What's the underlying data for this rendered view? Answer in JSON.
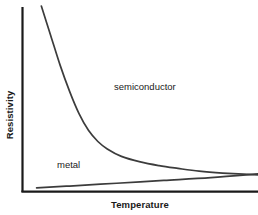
{
  "chart_data": {
    "type": "line",
    "title": "",
    "xlabel": "Temperature",
    "ylabel": "Resistivity",
    "grid": false,
    "legend_position": "inline-annotation",
    "axis_ticks": false,
    "tick_labels": {
      "x": [],
      "y": []
    },
    "xlim": [
      0,
      100
    ],
    "ylim": [
      0,
      100
    ],
    "axis_color": "#1a1a1a",
    "curve_color": "#3c3c3c",
    "background_color": "#ffffff",
    "series": [
      {
        "name": "semiconductor",
        "style": "exponential-decay",
        "color": "#3c3c3c",
        "label": "semiconductor",
        "x": [
          8,
          12,
          16,
          20,
          24,
          28,
          32,
          36,
          42,
          50,
          58,
          66,
          75,
          85,
          100
        ],
        "values": [
          100,
          84,
          68,
          54,
          42,
          33,
          27,
          23,
          19,
          16,
          14,
          12.5,
          11,
          10,
          9
        ]
      },
      {
        "name": "metal",
        "style": "linear-increase",
        "color": "#3c3c3c",
        "label": "metal",
        "x": [
          6,
          20,
          40,
          60,
          80,
          100
        ],
        "values": [
          2,
          3,
          4.5,
          6,
          7.5,
          9.5
        ]
      }
    ],
    "annotations": [
      {
        "text": "semiconductor",
        "x": 40,
        "y": 58
      },
      {
        "text": "metal",
        "x": 15,
        "y": 18
      }
    ]
  },
  "figure": {
    "xlabel": "Temperature",
    "ylabel": "Resistivity",
    "label_semiconductor": "semiconductor",
    "label_metal": "metal"
  }
}
